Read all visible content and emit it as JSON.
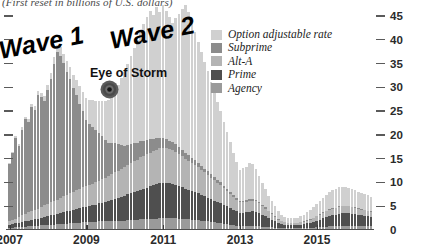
{
  "chart_subtitle": "(First reset in billions of U.S. dollars)",
  "annotations": {
    "wave_1": "Wave 1",
    "wave_2": "Wave 2",
    "eye_of_storm": "Eye of Storm",
    "eye_marker_icon": "storm-eye-icon"
  },
  "legend": {
    "position": "top-right-inside",
    "items": [
      {
        "label": "Option adjustable rate",
        "color": "#d0d0d0"
      },
      {
        "label": "Subprime",
        "color": "#8c8c8c"
      },
      {
        "label": "Alt-A",
        "color": "#b4b4b4"
      },
      {
        "label": "Prime",
        "color": "#4f4f4f"
      },
      {
        "label": "Agency",
        "color": "#9a9a9a"
      }
    ]
  },
  "chart_data": {
    "type": "bar",
    "stacked": true,
    "title": "(First reset in billions of U.S. dollars)",
    "xlabel": "",
    "ylabel": "",
    "ylim": [
      0,
      45
    ],
    "yticks": [
      0,
      5,
      10,
      15,
      20,
      25,
      30,
      35,
      40,
      45
    ],
    "yaxis_position": "right",
    "grid": false,
    "xticks": [
      "2007",
      "2009",
      "2011",
      "2013",
      "2015"
    ],
    "xtick_positions_months": [
      0,
      24,
      48,
      72,
      96
    ],
    "x_start": "2007-01",
    "x_end": "2016-06",
    "categories": [
      "2007-01",
      "2007-02",
      "2007-03",
      "2007-04",
      "2007-05",
      "2007-06",
      "2007-07",
      "2007-08",
      "2007-09",
      "2007-10",
      "2007-11",
      "2007-12",
      "2008-01",
      "2008-02",
      "2008-03",
      "2008-04",
      "2008-05",
      "2008-06",
      "2008-07",
      "2008-08",
      "2008-09",
      "2008-10",
      "2008-11",
      "2008-12",
      "2009-01",
      "2009-02",
      "2009-03",
      "2009-04",
      "2009-05",
      "2009-06",
      "2009-07",
      "2009-08",
      "2009-09",
      "2009-10",
      "2009-11",
      "2009-12",
      "2010-01",
      "2010-02",
      "2010-03",
      "2010-04",
      "2010-05",
      "2010-06",
      "2010-07",
      "2010-08",
      "2010-09",
      "2010-10",
      "2010-11",
      "2010-12",
      "2011-01",
      "2011-02",
      "2011-03",
      "2011-04",
      "2011-05",
      "2011-06",
      "2011-07",
      "2011-08",
      "2011-09",
      "2011-10",
      "2011-11",
      "2011-12",
      "2012-01",
      "2012-02",
      "2012-03",
      "2012-04",
      "2012-05",
      "2012-06",
      "2012-07",
      "2012-08",
      "2012-09",
      "2012-10",
      "2012-11",
      "2012-12",
      "2013-01",
      "2013-02",
      "2013-03",
      "2013-04",
      "2013-05",
      "2013-06",
      "2013-07",
      "2013-08",
      "2013-09",
      "2013-10",
      "2013-11",
      "2013-12",
      "2014-01",
      "2014-02",
      "2014-03",
      "2014-04",
      "2014-05",
      "2014-06",
      "2014-07",
      "2014-08",
      "2014-09",
      "2014-10",
      "2014-11",
      "2014-12",
      "2015-01",
      "2015-02",
      "2015-03",
      "2015-04",
      "2015-05",
      "2015-06",
      "2015-07",
      "2015-08",
      "2015-09",
      "2015-10",
      "2015-11",
      "2015-12",
      "2016-01",
      "2016-02",
      "2016-03",
      "2016-04",
      "2016-05",
      "2016-06"
    ],
    "series": [
      {
        "name": "Agency",
        "color": "#9a9a9a",
        "values": [
          0.5,
          0.5,
          0.6,
          0.6,
          0.7,
          0.7,
          0.8,
          0.8,
          0.9,
          0.9,
          1.0,
          1.0,
          1.0,
          1.1,
          1.1,
          1.2,
          1.2,
          1.3,
          1.3,
          1.4,
          1.4,
          1.5,
          1.5,
          1.6,
          1.6,
          1.6,
          1.7,
          1.7,
          1.8,
          1.8,
          1.8,
          1.9,
          1.9,
          2.0,
          2.0,
          2.0,
          2.0,
          2.1,
          2.1,
          2.2,
          2.2,
          2.3,
          2.3,
          2.3,
          2.4,
          2.4,
          2.4,
          2.5,
          2.5,
          2.5,
          2.5,
          2.5,
          2.5,
          2.4,
          2.4,
          2.3,
          2.3,
          2.2,
          2.2,
          2.1,
          2.0,
          1.9,
          1.8,
          1.7,
          1.6,
          1.5,
          1.4,
          1.3,
          1.2,
          1.1,
          1.0,
          0.9,
          0.8,
          0.8,
          0.8,
          0.8,
          0.8,
          0.8,
          0.8,
          0.7,
          0.7,
          0.6,
          0.6,
          0.5,
          0.4,
          0.4,
          0.4,
          0.4,
          0.4,
          0.4,
          0.4,
          0.4,
          0.4,
          0.5,
          0.5,
          0.5,
          0.6,
          0.6,
          0.7,
          0.7,
          0.8,
          0.8,
          0.8,
          0.9,
          0.9,
          0.9,
          0.9,
          0.9,
          0.9,
          0.9,
          0.9,
          0.9,
          0.9,
          0.9
        ]
      },
      {
        "name": "Prime",
        "color": "#4f4f4f",
        "values": [
          0.6,
          0.7,
          0.8,
          0.9,
          1.0,
          1.1,
          1.2,
          1.3,
          1.4,
          1.5,
          1.6,
          1.8,
          1.9,
          2.0,
          2.1,
          2.2,
          2.4,
          2.5,
          2.6,
          2.7,
          2.8,
          3.0,
          3.1,
          3.2,
          3.3,
          3.4,
          3.5,
          3.6,
          3.8,
          3.9,
          4.0,
          4.2,
          4.4,
          4.6,
          4.8,
          5.0,
          5.2,
          5.4,
          5.6,
          5.8,
          6.0,
          6.2,
          6.4,
          6.6,
          6.8,
          7.0,
          7.2,
          7.3,
          7.4,
          7.4,
          7.3,
          7.2,
          7.0,
          6.8,
          6.6,
          6.4,
          6.2,
          6.0,
          5.8,
          5.6,
          5.4,
          5.2,
          5.0,
          4.8,
          4.6,
          4.4,
          4.2,
          4.0,
          3.8,
          3.5,
          3.2,
          3.0,
          2.8,
          2.8,
          2.9,
          3.0,
          3.1,
          3.0,
          2.8,
          2.5,
          2.2,
          1.9,
          1.6,
          1.3,
          1.0,
          0.8,
          0.7,
          0.6,
          0.6,
          0.6,
          0.6,
          0.7,
          0.8,
          0.9,
          1.0,
          1.2,
          1.4,
          1.6,
          1.8,
          2.0,
          2.2,
          2.3,
          2.4,
          2.5,
          2.6,
          2.6,
          2.6,
          2.5,
          2.4,
          2.3,
          2.2,
          2.1,
          2.0,
          1.9
        ]
      },
      {
        "name": "Alt-A",
        "color": "#b4b4b4",
        "values": [
          0.8,
          0.9,
          1.0,
          1.2,
          1.4,
          1.5,
          1.7,
          1.8,
          2.0,
          2.1,
          2.3,
          2.4,
          2.5,
          2.7,
          2.8,
          3.0,
          3.1,
          3.3,
          3.4,
          3.6,
          3.7,
          3.9,
          4.0,
          4.2,
          4.3,
          4.4,
          4.5,
          4.7,
          4.8,
          5.0,
          5.1,
          5.3,
          5.4,
          5.6,
          5.7,
          5.9,
          6.0,
          6.2,
          6.3,
          6.5,
          6.6,
          6.8,
          6.9,
          7.0,
          7.1,
          7.2,
          7.3,
          7.4,
          7.4,
          7.3,
          7.2,
          7.1,
          6.9,
          6.7,
          6.5,
          6.3,
          6.1,
          5.9,
          5.7,
          5.5,
          5.2,
          5.0,
          4.8,
          4.5,
          4.3,
          4.0,
          3.8,
          3.5,
          3.2,
          3.0,
          2.7,
          2.5,
          2.2,
          2.2,
          2.2,
          2.3,
          2.3,
          2.2,
          2.0,
          1.8,
          1.6,
          1.4,
          1.2,
          1.0,
          0.8,
          0.6,
          0.5,
          0.4,
          0.4,
          0.4,
          0.4,
          0.5,
          0.5,
          0.6,
          0.7,
          0.8,
          0.9,
          1.0,
          1.1,
          1.2,
          1.3,
          1.4,
          1.4,
          1.5,
          1.5,
          1.5,
          1.5,
          1.4,
          1.4,
          1.3,
          1.2,
          1.2,
          1.1,
          1.0
        ]
      },
      {
        "name": "Subprime",
        "color": "#8c8c8c",
        "values": [
          12.0,
          14.0,
          17.0,
          15.0,
          18.0,
          20.0,
          19.0,
          22.0,
          21.0,
          24.0,
          23.0,
          22.0,
          24.0,
          26.0,
          29.0,
          31.0,
          30.0,
          28.0,
          26.0,
          24.0,
          22.0,
          20.0,
          18.0,
          16.0,
          14.0,
          13.0,
          12.0,
          11.0,
          10.0,
          9.0,
          8.0,
          7.0,
          6.5,
          6.0,
          5.5,
          5.0,
          4.5,
          4.2,
          4.0,
          3.8,
          3.6,
          3.4,
          3.2,
          3.0,
          2.8,
          2.6,
          2.4,
          2.2,
          2.0,
          1.9,
          1.8,
          1.7,
          1.6,
          1.5,
          1.4,
          1.3,
          1.2,
          1.1,
          1.0,
          0.9,
          0.9,
          0.8,
          0.8,
          0.7,
          0.7,
          0.6,
          0.6,
          0.5,
          0.5,
          0.5,
          0.4,
          0.4,
          0.4,
          0.4,
          0.4,
          0.4,
          0.4,
          0.3,
          0.3,
          0.3,
          0.3,
          0.2,
          0.2,
          0.2,
          0.2,
          0.1,
          0.1,
          0.1,
          0.1,
          0.1,
          0.1,
          0.1,
          0.1,
          0.1,
          0.1,
          0.1,
          0.1,
          0.1,
          0.1,
          0.1,
          0.1,
          0.1,
          0.1,
          0.1,
          0.1,
          0.1,
          0.1,
          0.1,
          0.1,
          0.1,
          0.1,
          0.1,
          0.1,
          0.1
        ]
      },
      {
        "name": "Option adjustable rate",
        "color": "#d0d0d0",
        "values": [
          0.3,
          0.3,
          0.4,
          0.4,
          0.5,
          0.5,
          0.6,
          0.6,
          0.7,
          0.8,
          0.9,
          1.0,
          1.1,
          1.2,
          1.4,
          1.6,
          1.8,
          2.0,
          2.2,
          2.5,
          2.8,
          3.2,
          3.6,
          4.0,
          4.5,
          5.0,
          5.6,
          6.2,
          6.8,
          7.5,
          8.2,
          9.0,
          10.0,
          11.0,
          12.5,
          14.0,
          15.5,
          17.0,
          18.5,
          20.0,
          21.5,
          23.0,
          24.5,
          26.0,
          27.0,
          26.0,
          27.5,
          26.5,
          28.0,
          27.0,
          26.0,
          25.0,
          26.5,
          28.0,
          29.5,
          31.0,
          30.0,
          28.5,
          27.0,
          25.5,
          24.0,
          22.5,
          21.0,
          19.5,
          18.0,
          16.5,
          15.0,
          13.5,
          12.0,
          10.5,
          9.0,
          7.5,
          6.5,
          6.8,
          7.0,
          7.5,
          7.2,
          6.5,
          5.5,
          4.5,
          3.8,
          3.0,
          2.5,
          2.0,
          1.6,
          1.3,
          1.1,
          1.0,
          1.0,
          1.0,
          1.1,
          1.2,
          1.4,
          1.6,
          1.9,
          2.2,
          2.5,
          2.8,
          3.1,
          3.4,
          3.6,
          3.8,
          3.9,
          4.0,
          4.0,
          3.9,
          3.8,
          3.7,
          3.6,
          3.5,
          3.4,
          3.3,
          3.2,
          3.1
        ]
      }
    ]
  }
}
